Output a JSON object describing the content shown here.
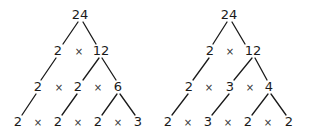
{
  "colors": {
    "line": "#1a1a1a",
    "text": "#1a1a1a",
    "background": "#ffffff"
  },
  "operator": "×",
  "trees": [
    {
      "root": "24",
      "level1": [
        "2",
        "12"
      ],
      "level2": [
        "2",
        "2",
        "6"
      ],
      "level3": [
        "2",
        "2",
        "2",
        "3"
      ]
    },
    {
      "root": "24",
      "level1": [
        "2",
        "12"
      ],
      "level2": [
        "2",
        "3",
        "4"
      ],
      "level3": [
        "2",
        "3",
        "2",
        "2"
      ]
    }
  ]
}
